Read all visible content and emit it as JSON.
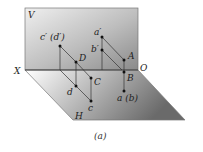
{
  "diagram": {
    "caption": "(a)",
    "planes": {
      "vertical": {
        "label": "V"
      },
      "horizontal": {
        "label": "H"
      }
    },
    "axis": {
      "left_label": "X",
      "right_label": "O"
    },
    "points": {
      "c_prime_d_prime": "c′ (d′)",
      "a_prime": "a′",
      "b_prime": "b′",
      "A": "A",
      "B": "B",
      "D": "D",
      "C": "C",
      "d": "d",
      "c": "c",
      "a_b": "a (b)"
    },
    "colors": {
      "v_plane_top": "#f2f2f2",
      "v_plane_bottom": "#8c8c8c",
      "h_plane_left": "#ffffff",
      "h_plane_right": "#6e6e6e",
      "lines": "#333333"
    }
  }
}
